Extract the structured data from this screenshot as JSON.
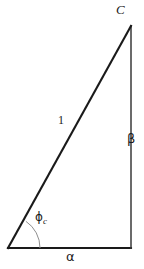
{
  "figure": {
    "background_color": "#ffffff",
    "stroke_color": "#1a1a1a",
    "arc_color": "#8a8a8a",
    "width": 144,
    "height": 269
  },
  "geometry": {
    "vertices": {
      "bottom_left": {
        "x": 8,
        "y": 248
      },
      "bottom_right": {
        "x": 131,
        "y": 248
      },
      "top_right": {
        "x": 131,
        "y": 26
      }
    },
    "angle_arc": {
      "center_x": 8,
      "center_y": 248,
      "radius": 32
    }
  },
  "labels": {
    "vertex_c": "C",
    "side_vertical": "β",
    "side_horizontal": "α",
    "side_hypotenuse": "1",
    "angle_base": "ϕ",
    "angle_base_subscript": "c"
  }
}
